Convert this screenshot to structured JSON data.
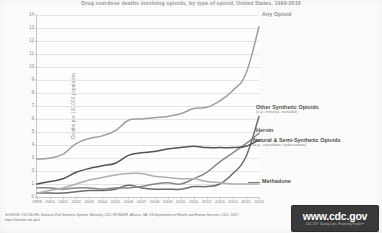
{
  "title": "Drug overdose deaths involving opioids, by type of opioid, United States, 1999-2016",
  "axes": {
    "ylabel": "Deaths per 100,000 population",
    "yticks": [
      "0",
      "1",
      "2",
      "3",
      "4",
      "5",
      "6",
      "7",
      "8",
      "9",
      "10",
      "11",
      "12",
      "13",
      "14"
    ],
    "ymin": 0,
    "ymax": 14,
    "xticks": [
      "1999",
      "2000",
      "2001",
      "2002",
      "2003",
      "2004",
      "2005",
      "2006",
      "2007",
      "2008",
      "2009",
      "2010",
      "2011",
      "2012",
      "2013",
      "2014",
      "2015",
      "2016"
    ],
    "xmin": 1999,
    "xmax": 2016
  },
  "annotations": {
    "any_opioid": {
      "label": "Any Opioid",
      "sub": ""
    },
    "other_synthetic": {
      "label": "Other Synthetic Opioids",
      "sub": "(e.g., fentanyl, tramadol)"
    },
    "heroin": {
      "label": "Heroin",
      "sub": ""
    },
    "natural_semi": {
      "label": "Natural & Semi-Synthetic Opioids",
      "sub": "(e.g., oxycodone, hydrocodone)"
    },
    "methadone": {
      "label": "Methadone",
      "sub": ""
    }
  },
  "footer": {
    "source_line1": "SOURCE: CDC/NCHS, National Vital Statistics System, Mortality. CDC WONDER, Atlanta, GA: US Department of Health and Human Services, CDC; 2017.",
    "source_line2": "https://wonder.cdc.gov/.",
    "logo_main": "www.cdc.gov",
    "logo_tagline": "CDC 24/7: Saving Lives, Protecting People™"
  },
  "colors": {
    "any_opioid": "#a0a0a0",
    "other_synthetic": "#6d6d6d",
    "heroin": "#888888",
    "natural_semi": "#555555",
    "methadone": "#b0b0b0",
    "grid": "#e3e6ea",
    "axis": "#c9c9c9",
    "logo_bg": "#3a3a3a"
  },
  "chart_data": {
    "type": "line",
    "title": "Drug overdose deaths involving opioids, by type of opioid, United States, 1999-2016",
    "xlabel": "",
    "ylabel": "Deaths per 100,000 population",
    "xlim": [
      1999,
      2016
    ],
    "ylim": [
      0,
      14
    ],
    "grid": true,
    "legend_position": "inline-annotations-right",
    "x": [
      1999,
      2000,
      2001,
      2002,
      2003,
      2004,
      2005,
      2006,
      2007,
      2008,
      2009,
      2010,
      2011,
      2012,
      2013,
      2014,
      2015,
      2016
    ],
    "series": [
      {
        "name": "Any Opioid",
        "color": "#a0a0a0",
        "values": [
          2.9,
          3.0,
          3.3,
          4.1,
          4.5,
          4.7,
          5.1,
          5.9,
          6.0,
          6.1,
          6.2,
          6.4,
          6.8,
          6.9,
          7.4,
          8.2,
          9.5,
          13.1
        ]
      },
      {
        "name": "Other Synthetic Opioids",
        "color": "#6d6d6d",
        "values": [
          0.3,
          0.3,
          0.3,
          0.4,
          0.5,
          0.5,
          0.6,
          0.9,
          0.7,
          0.6,
          0.6,
          0.6,
          0.8,
          0.8,
          1.0,
          1.8,
          3.1,
          6.2
        ]
      },
      {
        "name": "Heroin",
        "color": "#888888",
        "values": [
          0.7,
          0.7,
          0.6,
          0.7,
          0.7,
          0.6,
          0.7,
          0.7,
          0.8,
          1.0,
          1.1,
          1.0,
          1.4,
          1.9,
          2.7,
          3.4,
          4.1,
          4.9
        ]
      },
      {
        "name": "Natural & Semi-Synthetic Opioids",
        "color": "#555555",
        "values": [
          1.0,
          1.2,
          1.4,
          1.9,
          2.2,
          2.4,
          2.6,
          3.2,
          3.4,
          3.5,
          3.7,
          3.8,
          3.9,
          3.8,
          3.8,
          3.8,
          3.9,
          4.4
        ]
      },
      {
        "name": "Methadone",
        "color": "#b0b0b0",
        "values": [
          0.3,
          0.5,
          0.7,
          1.0,
          1.3,
          1.5,
          1.7,
          1.8,
          1.8,
          1.6,
          1.5,
          1.4,
          1.4,
          1.2,
          1.1,
          1.0,
          1.0,
          1.0
        ]
      }
    ]
  }
}
